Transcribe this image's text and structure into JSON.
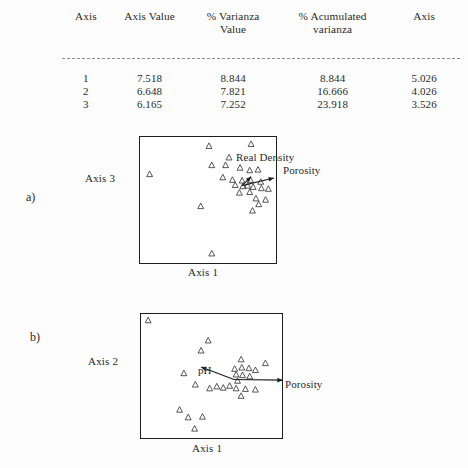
{
  "table": {
    "headers": [
      "Axis",
      "Axis Value",
      "% Varianza Value",
      "% Acumulated varianza",
      "Axis"
    ],
    "header_parts": {
      "variance_line1": "% Varianza",
      "variance_line2": "Value"
    },
    "rows": [
      {
        "axis": "1",
        "axis_value": "7.518",
        "variance": "8.844",
        "acumulated": "8.844",
        "axis2": "5.026"
      },
      {
        "axis": "2",
        "axis_value": "6.648",
        "variance": "7.821",
        "acumulated": "16.666",
        "axis2": "4.026"
      },
      {
        "axis": "3",
        "axis_value": "6.165",
        "variance": "7.252",
        "acumulated": "23.918",
        "axis2": "3.526"
      }
    ]
  },
  "panels": [
    {
      "tag": "a)",
      "y_axis_label": "Axis 3",
      "x_axis_label": "Axis 1",
      "vectors": [
        {
          "name": "Real Density",
          "label": "Real Density"
        },
        {
          "name": "Porosity",
          "label": "Porosity"
        }
      ]
    },
    {
      "tag": "b)",
      "y_axis_label": "Axis 2",
      "x_axis_label": "Axis 1",
      "vectors": [
        {
          "name": "pH",
          "label": "pH"
        },
        {
          "name": "Porosity",
          "label": "Porosity"
        }
      ]
    }
  ],
  "chart_data": [
    {
      "type": "scatter",
      "title": "",
      "panel": "a)",
      "xlabel": "Axis 1",
      "ylabel": "Axis 3",
      "xlim": [
        0,
        100
      ],
      "ylim": [
        0,
        100
      ],
      "grid": false,
      "legend": "none",
      "marker": "open-triangle",
      "points": [
        {
          "x": 50.0,
          "y": 93.0
        },
        {
          "x": 80.5,
          "y": 94.5
        },
        {
          "x": 64.5,
          "y": 84.0
        },
        {
          "x": 52.0,
          "y": 78.0
        },
        {
          "x": 62.0,
          "y": 78.0
        },
        {
          "x": 72.5,
          "y": 76.0
        },
        {
          "x": 79.5,
          "y": 74.0
        },
        {
          "x": 85.5,
          "y": 74.5
        },
        {
          "x": 7.0,
          "y": 71.0
        },
        {
          "x": 60.0,
          "y": 68.5
        },
        {
          "x": 67.0,
          "y": 66.5
        },
        {
          "x": 74.0,
          "y": 66.0
        },
        {
          "x": 80.0,
          "y": 66.5
        },
        {
          "x": 87.5,
          "y": 65.0
        },
        {
          "x": 69.0,
          "y": 62.5
        },
        {
          "x": 74.5,
          "y": 61.5
        },
        {
          "x": 78.0,
          "y": 62.0
        },
        {
          "x": 82.0,
          "y": 61.0
        },
        {
          "x": 88.0,
          "y": 60.0
        },
        {
          "x": 93.0,
          "y": 59.5
        },
        {
          "x": 72.0,
          "y": 56.5
        },
        {
          "x": 79.5,
          "y": 57.0
        },
        {
          "x": 84.0,
          "y": 52.0
        },
        {
          "x": 91.0,
          "y": 51.0
        },
        {
          "x": 86.0,
          "y": 47.5
        },
        {
          "x": 44.0,
          "y": 46.0
        },
        {
          "x": 81.5,
          "y": 42.5
        },
        {
          "x": 52.0,
          "y": 9.0
        }
      ],
      "vectors": [
        {
          "name": "Real Density",
          "x0": 74.0,
          "y0": 62.0,
          "x1": 80.5,
          "y1": 69.0
        },
        {
          "name": "Porosity",
          "x0": 74.0,
          "y0": 62.0,
          "x1": 97.0,
          "y1": 68.0
        }
      ]
    },
    {
      "type": "scatter",
      "title": "",
      "panel": "b)",
      "xlabel": "Axis 1",
      "ylabel": "Axis 2",
      "xlim": [
        0,
        100
      ],
      "ylim": [
        0,
        100
      ],
      "grid": false,
      "legend": "none",
      "marker": "open-triangle",
      "points": [
        {
          "x": 5.0,
          "y": 95.0
        },
        {
          "x": 47.0,
          "y": 79.0
        },
        {
          "x": 42.0,
          "y": 71.0
        },
        {
          "x": 70.0,
          "y": 64.0
        },
        {
          "x": 87.0,
          "y": 61.0
        },
        {
          "x": 65.5,
          "y": 56.5
        },
        {
          "x": 70.5,
          "y": 57.5
        },
        {
          "x": 75.5,
          "y": 57.0
        },
        {
          "x": 80.0,
          "y": 55.5
        },
        {
          "x": 30.0,
          "y": 53.0
        },
        {
          "x": 66.5,
          "y": 52.0
        },
        {
          "x": 71.0,
          "y": 51.5
        },
        {
          "x": 76.0,
          "y": 50.5
        },
        {
          "x": 67.5,
          "y": 47.0
        },
        {
          "x": 38.0,
          "y": 44.0
        },
        {
          "x": 48.0,
          "y": 41.0
        },
        {
          "x": 53.0,
          "y": 42.5
        },
        {
          "x": 57.5,
          "y": 41.5
        },
        {
          "x": 62.0,
          "y": 43.0
        },
        {
          "x": 66.5,
          "y": 41.0
        },
        {
          "x": 73.0,
          "y": 40.5
        },
        {
          "x": 80.0,
          "y": 40.0
        },
        {
          "x": 70.0,
          "y": 35.0
        },
        {
          "x": 27.0,
          "y": 24.0
        },
        {
          "x": 33.0,
          "y": 18.0
        },
        {
          "x": 43.0,
          "y": 18.5
        },
        {
          "x": 37.5,
          "y": 9.0
        }
      ],
      "vectors": [
        {
          "name": "pH",
          "x0": 65.0,
          "y0": 48.0,
          "x1": 42.0,
          "y1": 58.0
        },
        {
          "name": "Porosity",
          "x0": 65.0,
          "y0": 48.0,
          "x1": 99.0,
          "y1": 47.5
        }
      ]
    }
  ]
}
